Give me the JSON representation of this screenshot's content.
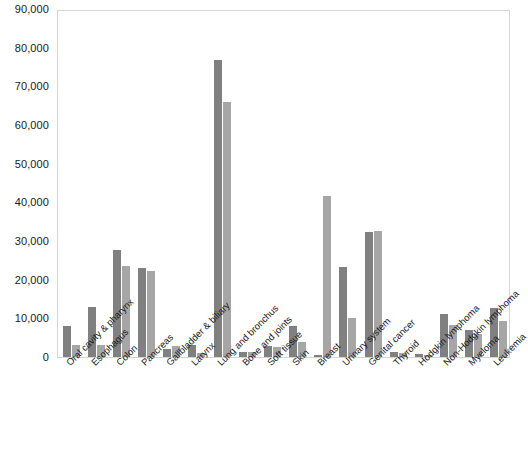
{
  "chart_data": {
    "type": "bar",
    "title": "",
    "subtitle": "",
    "xlabel": "",
    "ylabel": "",
    "ylim": [
      0,
      90000
    ],
    "ytick_values": [
      0,
      10000,
      20000,
      30000,
      40000,
      50000,
      60000,
      70000,
      80000,
      90000
    ],
    "ytick_labels": [
      "0",
      "10,000",
      "20,000",
      "30,000",
      "40,000",
      "50,000",
      "60,000",
      "70,000",
      "80,000",
      "90,000"
    ],
    "grid": false,
    "legend": "none",
    "legend_entries": [],
    "orientation": "vertical",
    "categories": [
      "Oral cavity & pharynx",
      "Esophagus",
      "Colon",
      "Pancreas",
      "Gallbladder & biliary",
      "Larynx",
      "Lung and bronchus",
      "Bone and joints",
      "Soft tissue",
      "Skin",
      "Breast",
      "Urinary system",
      "Genital cancer",
      "Thyroid",
      "Hodgkin lymphoma",
      "Non-Hodgkin lymphoma",
      "Myeloma",
      "Leukemia"
    ],
    "series": [
      {
        "name": "series-1",
        "color": "#808080",
        "values": [
          8100,
          12900,
          27700,
          23100,
          2200,
          3000,
          76700,
          1300,
          2900,
          7900,
          600,
          23200,
          32400,
          1300,
          700,
          11200,
          7000,
          12600
        ]
      },
      {
        "name": "series-2",
        "color": "#a6a6a6",
        "values": [
          3100,
          3200,
          23500,
          22300,
          2800,
          1100,
          66000,
          1200,
          2500,
          3900,
          41700,
          10000,
          32700,
          1000,
          400,
          8200,
          5900,
          9400
        ]
      }
    ]
  },
  "colors": {
    "series_1": "#808080",
    "series_2": "#a6a6a6",
    "plot_border": "#d4d4d4",
    "text": "#1a1a1a",
    "background": "#ffffff"
  }
}
